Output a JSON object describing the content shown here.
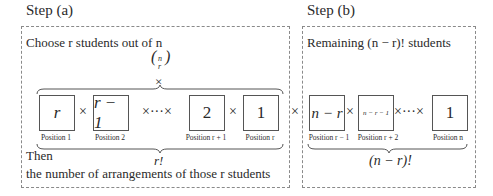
{
  "step_a": {
    "title": "Step (a)",
    "choose_text": "Choose r students out of n",
    "binom_top": "n",
    "binom_bottom": "r",
    "binom_times": "×",
    "boxes": [
      {
        "value": "r",
        "caption": "Position 1"
      },
      {
        "value": "r − 1",
        "caption": "Position 2"
      },
      {
        "value": "2",
        "caption": "Position r + 1"
      },
      {
        "value": "1",
        "caption": "Position r"
      }
    ],
    "ops": [
      "×",
      "×···×",
      "×"
    ],
    "then_text": "Then",
    "factorial_label": "r!",
    "arrangements_text": "the number of arrangements of those r students"
  },
  "between_op": "×",
  "step_b": {
    "title": "Step (b)",
    "remaining_text": "Remaining (n − r)! students",
    "boxes": [
      {
        "value": "n − r",
        "caption": "Position r − 1"
      },
      {
        "value": "n − r − 1",
        "caption": "Position r + 2"
      },
      {
        "value": "1",
        "caption": "Position n"
      }
    ],
    "ops": [
      "×",
      "×···×"
    ],
    "factorial_label": "(n − r)!"
  }
}
